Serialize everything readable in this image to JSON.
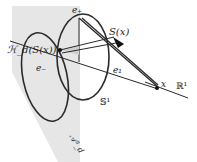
{
  "diagram": {
    "type": "geometric-construction",
    "labels": {
      "hyperplane_point": "ℋ_d(S(x))",
      "e_minus": "e₋",
      "e_plus": "e₊",
      "e_one": "e₁",
      "circle": "𝕊¹",
      "stereo_point": "S(x)",
      "point_x": "x",
      "real_line": "ℝ¹",
      "plane": "𝒜³_d"
    },
    "colors": {
      "plane_fill": "#e6e6e6",
      "stroke": "#2a2a2a",
      "cone_fill": "#cfcfcf",
      "background": "#ffffff"
    }
  }
}
